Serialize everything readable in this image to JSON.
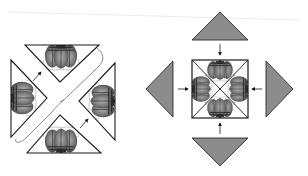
{
  "figure": {
    "colors": {
      "background": "#ffffff",
      "outline": "#1a1a1a",
      "grey_triangle": "#8c8c8c",
      "pumpkin_dark": "#4a4a4a",
      "pumpkin_mid": "#7a7a7a",
      "pumpkin_light": "#a8a8a8",
      "top_rule": "#e6e6e6"
    },
    "left_panel": {
      "label": "assembled-triangles-with-gap",
      "triangles": [
        "top",
        "left",
        "right",
        "bottom"
      ],
      "arrows": 2
    },
    "right_panel": {
      "label": "triangles-folding-to-square",
      "outer_triangles": [
        "top",
        "left",
        "right",
        "bottom"
      ],
      "arrows": 4,
      "center": "square-with-diagonals"
    }
  }
}
